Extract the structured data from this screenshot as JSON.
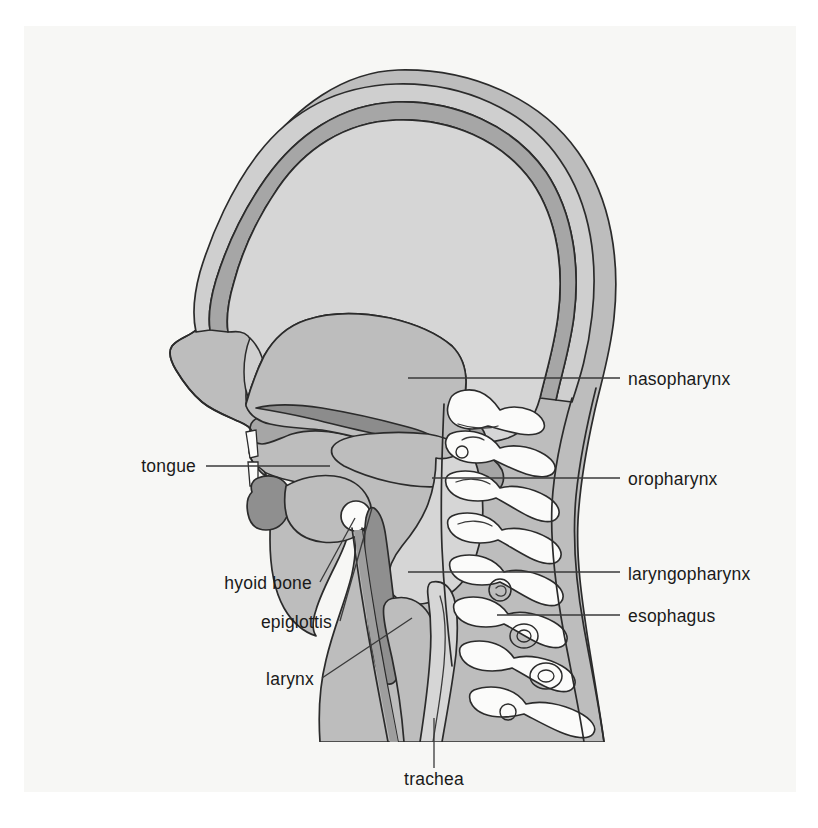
{
  "figure": {
    "background_color": "#ffffff",
    "page_color": "#f7f7f5"
  },
  "palette": {
    "soft_tissue": "#bdbdbd",
    "skull_bone": "#a6a6a6",
    "cranial_cavity": "#d6d6d6",
    "scalp": "#cfcfcf",
    "tongue": "#8f8f8f",
    "nasal_mucosa": "#a3a3a3",
    "bone_white": "#fbfbfa",
    "ink": "#2b2b2b",
    "leader": "#3a3a3a",
    "text": "#1a1a1a"
  },
  "labels": [
    {
      "id": "nasopharynx",
      "text": "nasopharynx",
      "side": "right",
      "text_x": 628,
      "text_y": 385,
      "leader": "M 408 378 L 620 378"
    },
    {
      "id": "oropharynx",
      "text": "oropharynx",
      "side": "right",
      "text_x": 628,
      "text_y": 485,
      "leader": "M 432 478 L 620 478"
    },
    {
      "id": "laryngopharynx",
      "text": "laryngopharynx",
      "side": "right",
      "text_x": 628,
      "text_y": 580,
      "leader": "M 408 572 L 620 572"
    },
    {
      "id": "esophagus",
      "text": "esophagus",
      "side": "right",
      "text_x": 628,
      "text_y": 622,
      "leader": "M 497 615 L 620 615"
    },
    {
      "id": "tongue",
      "text": "tongue",
      "side": "left",
      "text_x": 196,
      "text_y": 472,
      "leader": "M 206 466 L 330 466"
    },
    {
      "id": "hyoid-bone",
      "text": "hyoid bone",
      "side": "left",
      "text_x": 312,
      "text_y": 589,
      "leader": "M 320 582 L 355 518"
    },
    {
      "id": "epiglottis",
      "text": "epiglottis",
      "side": "left",
      "text_x": 332,
      "text_y": 628,
      "leader": "M 340 621 L 372 508"
    },
    {
      "id": "larynx",
      "text": "larynx",
      "side": "left",
      "text_x": 314,
      "text_y": 685,
      "leader": "M 322 678 L 412 618"
    },
    {
      "id": "trachea",
      "text": "trachea",
      "side": "mid",
      "text_x": 434,
      "text_y": 785,
      "leader": "M 434 718 L 434 768"
    }
  ]
}
